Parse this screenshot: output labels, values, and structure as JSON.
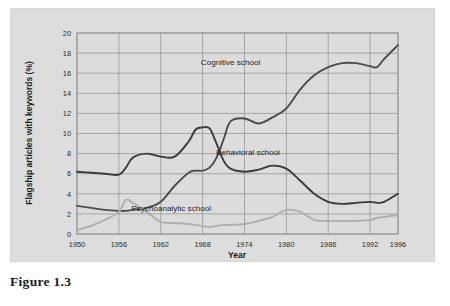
{
  "figure": {
    "caption": "Figure 1.3"
  },
  "chart_data": {
    "type": "line",
    "title": "",
    "xlabel": "Year",
    "ylabel": "Flagship articles with keywords (%)",
    "xlim": [
      1950,
      1996
    ],
    "ylim": [
      0,
      20
    ],
    "xticks": [
      "1950",
      "1956",
      "1962",
      "1968",
      "1974",
      "1980",
      "1986",
      "1992",
      "1996"
    ],
    "yticks": [
      "0",
      "2",
      "4",
      "6",
      "8",
      "10",
      "12",
      "14",
      "16",
      "18",
      "20"
    ],
    "grid": true,
    "legend_position": "inline-annotations",
    "colors": {
      "cognitive": "#4c4c4c",
      "behavioral": "#3a3a3a",
      "psychoanalytic": "#b0b0b0",
      "plot_background": "#dcdcdc",
      "panel_background": "#dddddd",
      "grid": "#8e8e8e",
      "frame": "#6f6f6f"
    },
    "x": [
      1950,
      1952,
      1954,
      1956,
      1957,
      1958,
      1960,
      1962,
      1964,
      1966,
      1967,
      1968,
      1969,
      1970,
      1971,
      1972,
      1974,
      1976,
      1978,
      1980,
      1982,
      1984,
      1986,
      1988,
      1990,
      1992,
      1993,
      1994,
      1996
    ],
    "series": [
      {
        "name": "Cognitive school",
        "label": "Cognitive school",
        "color": "#4c4c4c",
        "values": [
          2.8,
          2.6,
          2.4,
          2.3,
          2.3,
          2.4,
          2.6,
          3.2,
          4.8,
          6.1,
          6.3,
          6.3,
          6.6,
          7.6,
          9.4,
          11.2,
          11.5,
          11.0,
          11.6,
          12.5,
          14.4,
          15.8,
          16.6,
          17.0,
          17.0,
          16.7,
          16.6,
          17.4,
          18.8
        ]
      },
      {
        "name": "Behavioral school",
        "label": "Behavioral school",
        "color": "#3a3a3a",
        "values": [
          6.2,
          6.1,
          6.0,
          5.9,
          6.6,
          7.6,
          8.0,
          7.7,
          7.7,
          9.2,
          10.4,
          10.6,
          10.5,
          9.0,
          7.3,
          6.5,
          6.2,
          6.4,
          6.8,
          6.5,
          5.3,
          4.0,
          3.2,
          3.0,
          3.1,
          3.2,
          3.1,
          3.2,
          4.0
        ]
      },
      {
        "name": "Psychoanalytic school",
        "label": "Psychoanalytic school",
        "color": "#b0b0b0",
        "values": [
          0.4,
          0.8,
          1.4,
          2.2,
          3.4,
          3.1,
          2.2,
          1.2,
          1.1,
          1.0,
          0.9,
          0.8,
          0.7,
          0.8,
          0.9,
          0.9,
          1.0,
          1.3,
          1.7,
          2.4,
          2.2,
          1.4,
          1.3,
          1.3,
          1.3,
          1.4,
          1.6,
          1.7,
          1.9
        ]
      }
    ],
    "annotations": [
      {
        "text": "Cognitive school",
        "x": 1972,
        "y": 16.8
      },
      {
        "text": "Behavioral school",
        "x": 1974.5,
        "y": 7.9
      },
      {
        "text": "Psychoanalytic school",
        "x": 1963.5,
        "y": 2.3
      }
    ]
  }
}
